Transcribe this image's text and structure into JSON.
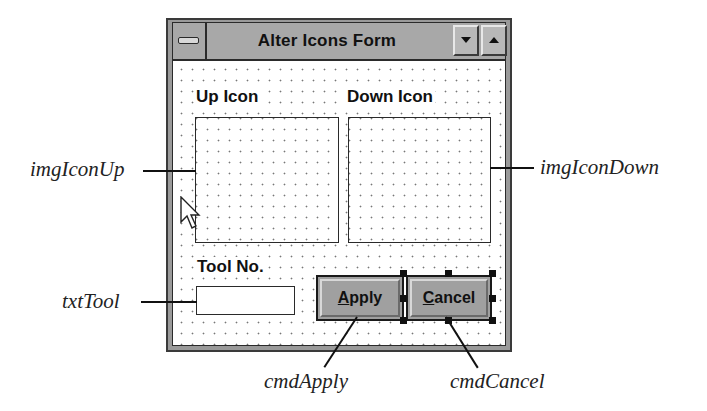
{
  "window": {
    "title": "Alter Icons Form",
    "icons": {
      "system_menu": "control-menu-box-icon",
      "minimize": "triangle-down-icon",
      "maximize": "triangle-up-icon"
    }
  },
  "form": {
    "up_icon_label": "Up Icon",
    "down_icon_label": "Down Icon",
    "tool_no_label": "Tool No.",
    "txt_tool_value": "",
    "apply_button": {
      "accel": "A",
      "rest": "pply",
      "label": "Apply"
    },
    "cancel_button": {
      "accel": "C",
      "rest": "ancel",
      "label": "Cancel"
    }
  },
  "callouts": {
    "img_icon_up": "imgIconUp",
    "img_icon_down": "imgIconDown",
    "txt_tool": "txtTool",
    "cmd_apply": "cmdApply",
    "cmd_cancel": "cmdCancel"
  },
  "colors": {
    "titlebar": "#a8a8a8",
    "button_face": "#a0a0a0",
    "frame": "#3a3a3a",
    "background": "#ffffff"
  }
}
